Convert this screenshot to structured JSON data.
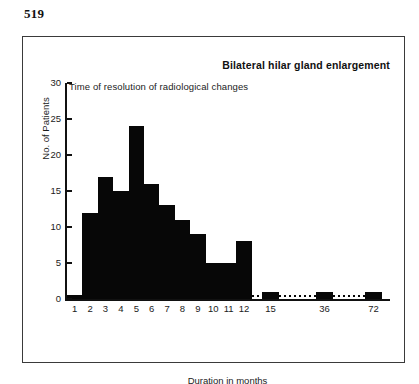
{
  "page": {
    "number": "519"
  },
  "figure": {
    "title": "Bilateral hilar gland enlargement",
    "subtitle": "Time of resolution of radiological changes"
  },
  "chart_data": {
    "type": "bar",
    "title": "Bilateral hilar gland enlargement",
    "subtitle": "Time of resolution of radiological changes",
    "xlabel": "Duration in months",
    "ylabel": "No. of Patients",
    "ylim": [
      0,
      30
    ],
    "ytick_labels": [
      "0",
      "5",
      "10",
      "15",
      "20",
      "25",
      "30"
    ],
    "ytick_values": [
      0,
      5,
      10,
      15,
      20,
      25,
      30
    ],
    "grid": false,
    "legend": "none",
    "categories": [
      "1",
      "2",
      "3",
      "4",
      "5",
      "6",
      "7",
      "8",
      "9",
      "10",
      "11",
      "12",
      "15",
      "36",
      "72"
    ],
    "values": [
      0.5,
      12,
      17,
      15,
      24,
      16,
      13,
      11,
      9,
      5,
      5,
      8,
      1,
      1,
      1
    ],
    "break_after_category": "12",
    "note": "Bars for 15, 36 and 72 months are separated by dotted connector lines along the axis"
  }
}
